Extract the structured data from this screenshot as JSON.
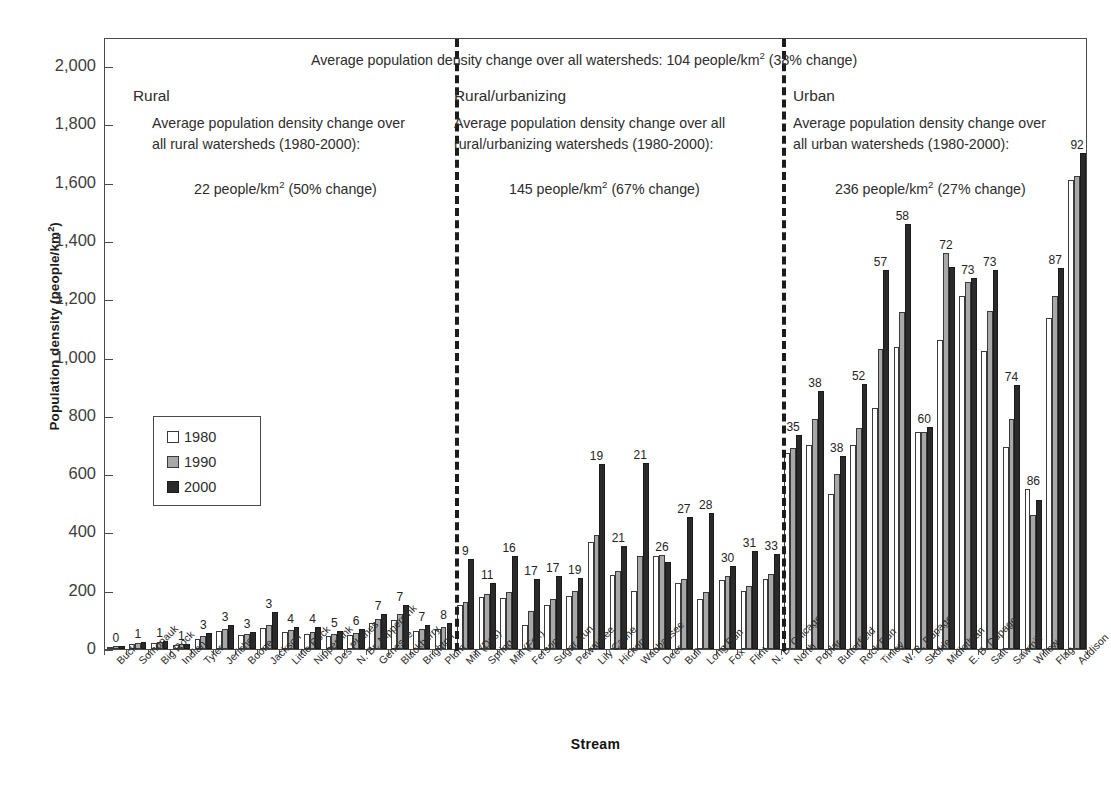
{
  "chart_data": {
    "type": "bar",
    "title": "",
    "xlabel": "Stream",
    "ylabel": "Population density (people/km2)",
    "ylabel_base": "Population density (people/km",
    "ylabel_sup": "2",
    "ylabel_tail": ")",
    "ylim": [
      0,
      2100
    ],
    "ytick_values": [
      0,
      200,
      400,
      600,
      800,
      1000,
      1200,
      1400,
      1600,
      1800,
      2000
    ],
    "ytick_labels": [
      "0",
      "200",
      "400",
      "600",
      "800",
      "1,000",
      "1,200",
      "1,400",
      "1,600",
      "1,800",
      "2,000"
    ],
    "grid": false,
    "legend_position": "inside-left",
    "legend": [
      {
        "label": "1980",
        "color": "#ffffff"
      },
      {
        "label": "1990",
        "color": "#a8a8a8"
      },
      {
        "label": "2000",
        "color": "#2a2a2a"
      }
    ],
    "series_names": [
      "1980",
      "1990",
      "2000"
    ],
    "categories": [
      "Buck",
      "Somonauk",
      "Big Rock",
      "Indian",
      "Tyler",
      "Jericho",
      "Boone",
      "Jackson",
      "Little Rock",
      "Nippersink",
      "Des Plaines",
      "N. Br. Nippersink",
      "Genesee",
      "Blackberry",
      "Brighton",
      "Plum",
      "Mill (Des)",
      "Spring",
      "Mill (Fox)",
      "Ferson",
      "Sugar Run",
      "Pewaukee",
      "Lily Cache",
      "Hickory",
      "Waubansee",
      "Deer",
      "Bull",
      "Long Run",
      "Fox",
      "Flint",
      "N. B. Chicago",
      "North",
      "Poplar",
      "Butterfield",
      "Rock Run",
      "Tinley",
      "W. B. Dupage",
      "Skokie",
      "Midlothian",
      "E. B. Dupage",
      "Salt",
      "Sawmill",
      "Willow",
      "Flag",
      "Addison"
    ],
    "series": [
      {
        "name": "1980",
        "values": [
          8,
          18,
          22,
          15,
          36,
          62,
          48,
          72,
          60,
          52,
          44,
          48,
          88,
          100,
          62,
          68,
          152,
          178,
          176,
          82,
          150,
          182,
          368,
          254,
          200,
          318,
          228,
          172,
          238,
          200,
          240,
          672,
          700,
          532,
          700,
          826,
          1038,
          744,
          1062,
          1210,
          1024,
          692,
          548,
          1136,
          1608
        ]
      },
      {
        "name": "1990",
        "values": [
          10,
          20,
          24,
          16,
          44,
          70,
          52,
          82,
          66,
          60,
          50,
          56,
          102,
          120,
          70,
          76,
          162,
          190,
          196,
          130,
          172,
          200,
          392,
          268,
          318,
          322,
          240,
          196,
          250,
          216,
          256,
          690,
          790,
          600,
          760,
          1028,
          1156,
          744,
          1360,
          1258,
          1160,
          788,
          460,
          1210,
          1622
        ]
      },
      {
        "name": "2000",
        "values": [
          11,
          24,
          26,
          18,
          54,
          82,
          58,
          126,
          74,
          74,
          62,
          70,
          120,
          152,
          84,
          88,
          308,
          226,
          318,
          240,
          250,
          244,
          634,
          352,
          638,
          300,
          454,
          466,
          284,
          336,
          326,
          736,
          884,
          662,
          910,
          1302,
          1460,
          762,
          1312,
          1272,
          1302,
          906,
          512,
          1306,
          1702
        ]
      }
    ],
    "bar_value_labels": [
      "0",
      "1",
      "1",
      "1",
      "3",
      "3",
      "3",
      "3",
      "4",
      "4",
      "5",
      "6",
      "7",
      "7",
      "7",
      "8",
      "9",
      "11",
      "16",
      "17",
      "17",
      "19",
      "19",
      "21",
      "21",
      "26",
      "27",
      "28",
      "30",
      "31",
      "33",
      "35",
      "38",
      "38",
      "52",
      "57",
      "58",
      "60",
      "72",
      "73",
      "73",
      "74",
      "86",
      "87",
      "92"
    ],
    "group_dividers": [
      16,
      31
    ],
    "annotations": {
      "overall": "Average population density change over all watersheds:  104 people/km2 (38% change)",
      "overall_pre": "Average population density change over all watersheds:  104 people/km",
      "overall_sup": "2",
      "overall_post": " (38% change)",
      "groups": [
        {
          "heading": "Rural",
          "line1": "Average population density change over",
          "line2": "all rural watersheds (1980-2000):",
          "value_pre": "22 people/km",
          "value_sup": "2",
          "value_post": " (50% change)"
        },
        {
          "heading": "Rural/urbanizing",
          "line1": "Average population density change over all",
          "line2": "rural/urbanizing watersheds (1980-2000):",
          "value_pre": "145 people/km",
          "value_sup": "2",
          "value_post": " (67% change)"
        },
        {
          "heading": "Urban",
          "line1": "Average population density change over",
          "line2": "all urban watersheds (1980-2000):",
          "value_pre": "236 people/km",
          "value_sup": "2",
          "value_post": " (27% change)"
        }
      ]
    }
  }
}
